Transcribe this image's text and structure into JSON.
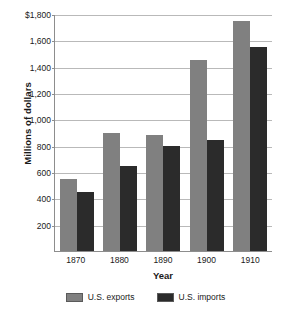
{
  "chart_data": {
    "type": "bar",
    "title": "",
    "xlabel": "Year",
    "ylabel": "Millions of dollars",
    "categories": [
      "1870",
      "1880",
      "1890",
      "1900",
      "1910"
    ],
    "series": [
      {
        "name": "U.S. exports",
        "color": "#808080",
        "values": [
          550,
          900,
          880,
          1450,
          1750
        ]
      },
      {
        "name": "U.S. imports",
        "color": "#2b2b2b",
        "values": [
          450,
          645,
          800,
          845,
          1550
        ]
      }
    ],
    "ylim": [
      0,
      1800
    ],
    "ytick_values": [
      1800,
      1600,
      1400,
      1200,
      1000,
      800,
      600,
      400,
      200
    ],
    "ytick_labels": [
      "$1,800",
      "1,600",
      "1,400",
      "1,200",
      "1,000",
      "800",
      "600",
      "400",
      "200"
    ],
    "grid": true,
    "legend_position": "bottom"
  },
  "legend": {
    "items": [
      {
        "label": "U.S. exports",
        "color": "#808080"
      },
      {
        "label": "U.S. imports",
        "color": "#2b2b2b"
      }
    ]
  }
}
